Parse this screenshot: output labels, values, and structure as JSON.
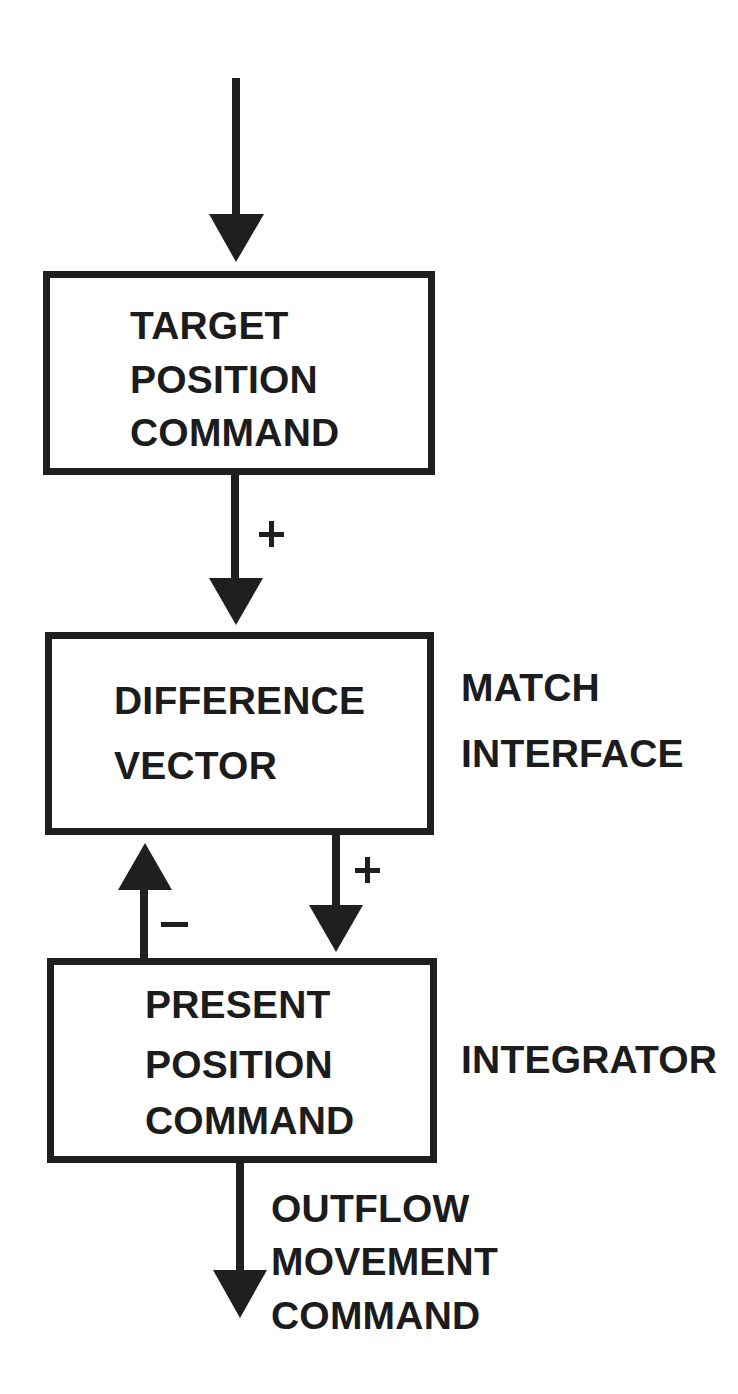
{
  "diagram": {
    "type": "block-diagram",
    "boxes": [
      {
        "id": "target",
        "lines": [
          "TARGET",
          "POSITION",
          "COMMAND"
        ]
      },
      {
        "id": "difference",
        "lines": [
          "DIFFERENCE",
          "VECTOR"
        ]
      },
      {
        "id": "present",
        "lines": [
          "PRESENT",
          "POSITION",
          "COMMAND"
        ]
      }
    ],
    "side_labels": {
      "match_interface": [
        "MATCH",
        "INTERFACE"
      ],
      "integrator": [
        "INTEGRATOR"
      ]
    },
    "output_label": [
      "OUTFLOW",
      "MOVEMENT",
      "COMMAND"
    ],
    "signs": {
      "target_to_difference": "+",
      "difference_to_present": "+",
      "present_to_difference": "−"
    },
    "edges": [
      {
        "from": "input",
        "to": "target"
      },
      {
        "from": "target",
        "to": "difference",
        "sign": "+"
      },
      {
        "from": "difference",
        "to": "present",
        "sign": "+"
      },
      {
        "from": "present",
        "to": "difference",
        "sign": "−"
      },
      {
        "from": "present",
        "to": "output"
      }
    ],
    "colors": {
      "ink": "#1f1f1f",
      "background": "#ffffff"
    }
  }
}
